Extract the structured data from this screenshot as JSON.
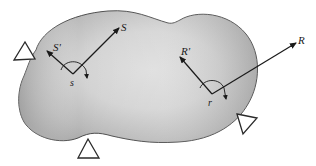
{
  "diagram": {
    "type": "rigid-body-with-supports",
    "body": {
      "fill_light": "#e6e6e6",
      "fill_dark": "#a9a9a9",
      "stroke": "#3a3a3a"
    },
    "supports": [
      {
        "id": "left",
        "shape": "triangle"
      },
      {
        "id": "bottom",
        "shape": "triangle"
      },
      {
        "id": "right",
        "shape": "triangle"
      }
    ],
    "points": [
      {
        "id": "s",
        "label": "s",
        "axes": [
          {
            "label": "S"
          },
          {
            "label": "S'"
          }
        ]
      },
      {
        "id": "r",
        "label": "r",
        "axes": [
          {
            "label": "R"
          },
          {
            "label": "R'"
          }
        ]
      }
    ],
    "labels": {
      "point_s": "s",
      "axis_S": "S",
      "axis_S_prime": "S'",
      "point_r": "r",
      "axis_R": "R",
      "axis_R_prime": "R'"
    }
  }
}
